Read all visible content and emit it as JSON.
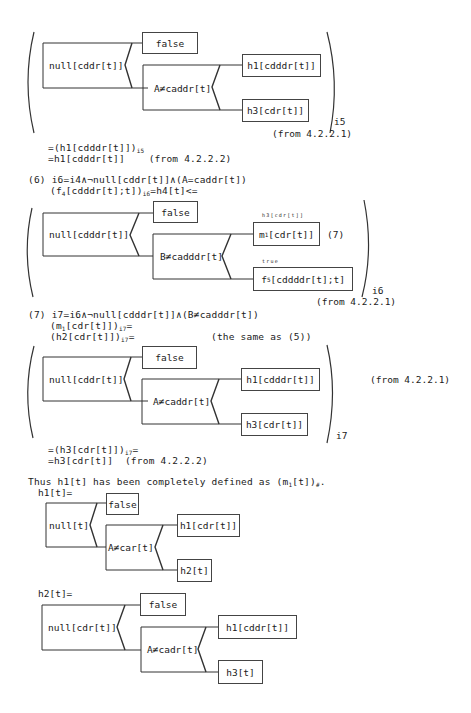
{
  "diagram1": {
    "condition": "null[cddr[t]]",
    "false_box": "false",
    "inner_condition": "A≠caddr[t]",
    "upper_box": "h1[cdddr[t]]",
    "lower_box": "h3[cdr[t]]",
    "subscript": "i5",
    "note": "(from 4.2.2.1)"
  },
  "after1": {
    "line1": "=(h1[cdddr[t]])",
    "line1_sub": "i5",
    "line2": "=h1[cdddr[t]]    (from 4.2.2.2)"
  },
  "step6": {
    "line1": "(6) i6=i4∧¬null[cddr[t]]∧(A=caddr[t])",
    "line2a": "(f",
    "line2a_sub": "4",
    "line2b": "[cdddr[t];t])",
    "line2b_sub": "i6",
    "line2c": "=h4[t]<="
  },
  "diagram2": {
    "condition": "null[cdddr[t]]",
    "false_box": "false",
    "inner_condition": "B≠cadddr[t]",
    "upper_annotation": "h3[cdr[t]]",
    "upper_box_a": "m",
    "upper_box_sub": "1",
    "upper_box_b": "[cdr[t]]",
    "upper_ref": "(7)",
    "lower_annotation": "true",
    "lower_box_a": "f",
    "lower_box_sub": "5",
    "lower_box_b": "[cddddr[t];t]",
    "subscript": "i6",
    "note": "(from 4.2.2.1)"
  },
  "step7": {
    "line1": "(7) i7=i6∧¬null[cdddr[t]]∧(B≠cadddr[t])",
    "line2a": "(m",
    "line2a_sub": "1",
    "line2b": "[cdr[t]])",
    "line2b_sub": "i7",
    "line2c": "=",
    "line3a": "(h2[cdr[t]])",
    "line3_sub": "i7",
    "line3b": "=",
    "line3_note": "(the same as (5))"
  },
  "diagram3": {
    "condition": "null[cddr[t]]",
    "false_box": "false",
    "inner_condition": "A≠caddr[t]",
    "upper_box": "h1[cdddr[t]]",
    "lower_box": "h3[cdr[t]]",
    "subscript": "i7",
    "note": "(from 4.2.2.1)"
  },
  "after3": {
    "line1": "=(h3[cdr[t]])",
    "line1_sub": "i7",
    "line1_end": "=",
    "line2": "=h3[cdr[t]]  (from 4.2.2.2)"
  },
  "conclusion": {
    "text_a": "Thus h1[t] has been completely defined as (m",
    "text_sub": "1",
    "text_b": "[t])",
    "text_sub2": "#",
    "text_end": "."
  },
  "h1_def": {
    "title": "h1[t]=",
    "condition": "null[t]",
    "false_box": "false",
    "inner_condition": "A≠car[t]",
    "upper_box": "h1[cdr[t]]",
    "lower_box": "h2[t]"
  },
  "h2_def": {
    "title": "h2[t]=",
    "condition": "null[cdr[t]]",
    "false_box": "false",
    "inner_condition": "A≠cadr[t]",
    "upper_box": "h1[cddr[t]]",
    "lower_box": "h3[t]"
  }
}
